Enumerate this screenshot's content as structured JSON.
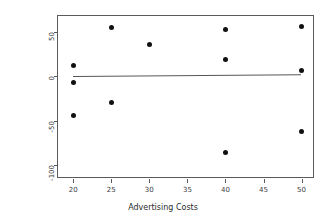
{
  "chart_data": {
    "type": "scatter",
    "title": "",
    "xlabel": "Advertising Costs",
    "ylabel": "Residual",
    "xlim": [
      18.0,
      51.5
    ],
    "ylim": [
      -113,
      68
    ],
    "grid": false,
    "legend": null,
    "xticks": [
      20,
      25,
      30,
      35,
      40,
      45,
      50
    ],
    "xtick_labels": [
      "20",
      "25",
      "30",
      "35",
      "40",
      "45",
      "50"
    ],
    "yticks": [
      50,
      0,
      -50,
      -100
    ],
    "ytick_labels": [
      "50",
      "0",
      "-50",
      "-100"
    ],
    "point_color": "#111111",
    "line_color": "#555555",
    "frame_color": "#5a5a5a",
    "x": [
      20,
      20,
      20,
      25,
      25,
      30,
      40,
      40,
      40,
      50,
      50,
      50
    ],
    "y": [
      12,
      -7,
      -44,
      55,
      -29,
      36,
      53,
      19,
      -85,
      56,
      7,
      -62
    ],
    "points": [
      {
        "x": 20,
        "y": 12
      },
      {
        "x": 20,
        "y": -7
      },
      {
        "x": 20,
        "y": -44
      },
      {
        "x": 25,
        "y": 55
      },
      {
        "x": 25,
        "y": -29
      },
      {
        "x": 30,
        "y": 36
      },
      {
        "x": 40,
        "y": 53
      },
      {
        "x": 40,
        "y": 19
      },
      {
        "x": 40,
        "y": -85
      },
      {
        "x": 50,
        "y": 56
      },
      {
        "x": 50,
        "y": 7
      },
      {
        "x": 50,
        "y": -62
      }
    ],
    "reference_line": {
      "type": "fit",
      "x_start": 20,
      "y_start": 1,
      "x_end": 50,
      "y_end": 3
    }
  }
}
